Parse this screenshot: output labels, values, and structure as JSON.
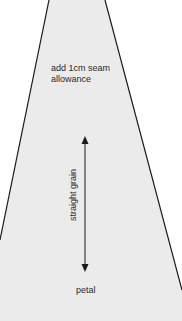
{
  "diagram": {
    "shape": "petal-pattern-piece",
    "fill_color": "#ebebeb",
    "outline_color": "#1a1a1a",
    "background_color": "#ffffff",
    "seam_note": {
      "line1": "add 1cm seam",
      "line2": "allowance"
    },
    "grain_label": "straight grain",
    "piece_label": "petal",
    "icons": [
      "double-headed-arrow-icon"
    ]
  }
}
